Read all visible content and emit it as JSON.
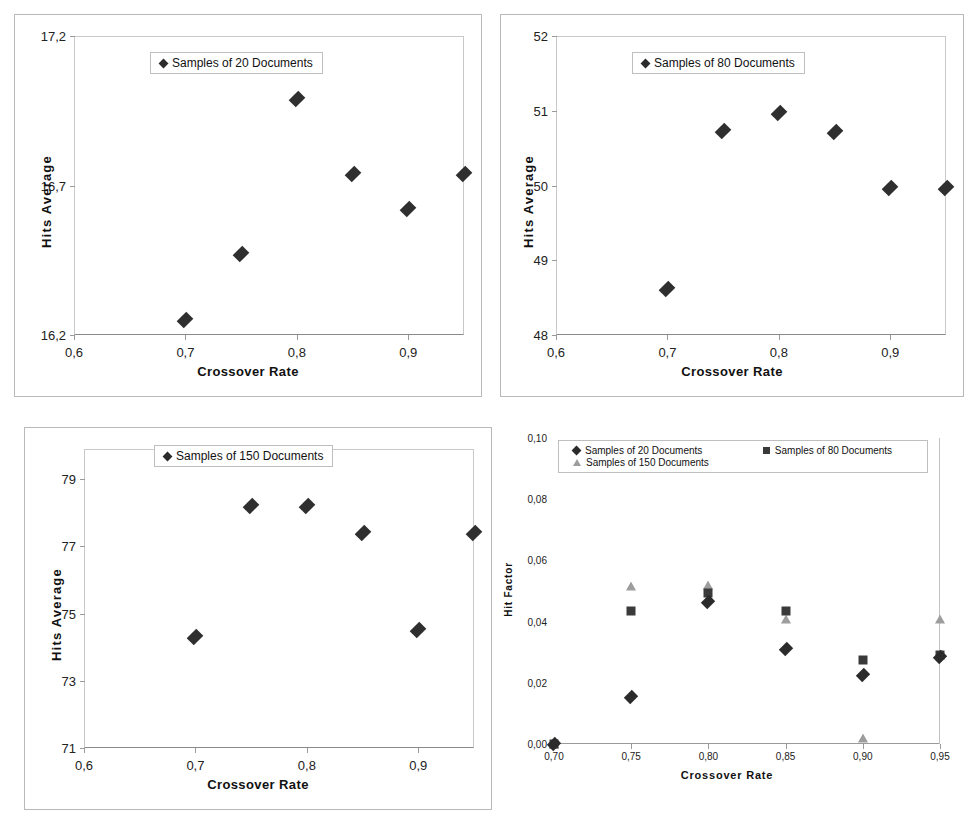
{
  "figure": {
    "panels": [
      "a",
      "b",
      "c",
      "d"
    ]
  },
  "chart_data": [
    {
      "id": "a",
      "type": "scatter",
      "title": "",
      "xlabel": "Crossover Rate",
      "ylabel": "Hits Average",
      "xlim": [
        0.6,
        0.95
      ],
      "ylim": [
        16.2,
        17.2
      ],
      "xticks": [
        "0,6",
        "0,7",
        "0,8",
        "0,9"
      ],
      "xtick_values": [
        0.6,
        0.7,
        0.8,
        0.9
      ],
      "yticks": [
        "16,2",
        "16,7",
        "17,2"
      ],
      "ytick_values": [
        16.2,
        16.7,
        17.2
      ],
      "grid": false,
      "legend_position": "top-center",
      "series": [
        {
          "name": "Samples of 20 Documents",
          "marker": "diamond",
          "x": [
            0.7,
            0.75,
            0.8,
            0.85,
            0.9,
            0.95
          ],
          "values": [
            16.25,
            16.47,
            16.99,
            16.74,
            16.62,
            16.74
          ]
        }
      ]
    },
    {
      "id": "b",
      "type": "scatter",
      "title": "",
      "xlabel": "Crossover Rate",
      "ylabel": "Hits Average",
      "xlim": [
        0.6,
        0.95
      ],
      "ylim": [
        48,
        52
      ],
      "xticks": [
        "0,6",
        "0,7",
        "0,8",
        "0,9"
      ],
      "xtick_values": [
        0.6,
        0.7,
        0.8,
        0.9
      ],
      "yticks": [
        "48",
        "49",
        "50",
        "51",
        "52"
      ],
      "ytick_values": [
        48,
        49,
        50,
        51,
        52
      ],
      "grid": false,
      "legend_position": "top-center",
      "series": [
        {
          "name": "Samples of 80 Documents",
          "marker": "diamond",
          "x": [
            0.7,
            0.75,
            0.8,
            0.85,
            0.9,
            0.95
          ],
          "values": [
            48.62,
            50.73,
            50.97,
            50.71,
            49.97,
            49.96
          ]
        }
      ]
    },
    {
      "id": "c",
      "type": "scatter",
      "title": "",
      "xlabel": "Crossover Rate",
      "ylabel": "Hits Average",
      "xlim": [
        0.6,
        0.95
      ],
      "ylim": [
        71,
        79.9
      ],
      "xticks": [
        "0,6",
        "0,7",
        "0,8",
        "0,9"
      ],
      "xtick_values": [
        0.6,
        0.7,
        0.8,
        0.9
      ],
      "yticks": [
        "71",
        "73",
        "75",
        "77",
        "79"
      ],
      "ytick_values": [
        71,
        73,
        75,
        77,
        79
      ],
      "grid": false,
      "legend_position": "top-center",
      "series": [
        {
          "name": "Samples of 150 Documents",
          "marker": "diamond",
          "x": [
            0.7,
            0.75,
            0.8,
            0.85,
            0.9,
            0.95
          ],
          "values": [
            74.3,
            78.2,
            78.2,
            77.4,
            74.5,
            77.4
          ]
        }
      ]
    },
    {
      "id": "d",
      "type": "scatter",
      "title": "",
      "xlabel": "Crossover Rate",
      "ylabel": "Hit Factor",
      "xlim": [
        0.7,
        0.95
      ],
      "ylim": [
        0.0,
        0.1
      ],
      "xticks": [
        "0,70",
        "0,75",
        "0,80",
        "0,85",
        "0,90",
        "0,95"
      ],
      "xtick_values": [
        0.7,
        0.75,
        0.8,
        0.85,
        0.9,
        0.95
      ],
      "yticks": [
        "0,00",
        "0,02",
        "0,04",
        "0,06",
        "0,08",
        "0,10"
      ],
      "ytick_values": [
        0.0,
        0.02,
        0.04,
        0.06,
        0.08,
        0.1
      ],
      "grid": false,
      "legend_position": "top-center",
      "series": [
        {
          "name": "Samples of  20 Documents",
          "marker": "diamond",
          "x": [
            0.7,
            0.75,
            0.8,
            0.85,
            0.9,
            0.95
          ],
          "values": [
            0.0,
            0.0155,
            0.0465,
            0.031,
            0.0225,
            0.0285
          ]
        },
        {
          "name": "Samples of  80 Documents",
          "marker": "square",
          "x": [
            0.7,
            0.75,
            0.8,
            0.85,
            0.9,
            0.95
          ],
          "values": [
            0.0,
            0.0435,
            0.0495,
            0.0435,
            0.0275,
            0.029
          ]
        },
        {
          "name": "Samples of  150 Documents",
          "marker": "triangle",
          "x": [
            0.7,
            0.75,
            0.8,
            0.85,
            0.9,
            0.95
          ],
          "values": [
            0.0,
            0.0515,
            0.052,
            0.041,
            0.002,
            0.041
          ]
        }
      ]
    }
  ]
}
